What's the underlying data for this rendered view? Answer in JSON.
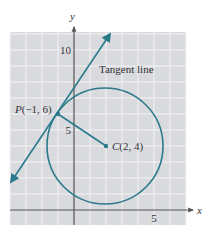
{
  "diagram": {
    "axes": {
      "x_label": "x",
      "y_label": "y",
      "x_ticks": [
        {
          "value": 5,
          "label": "5"
        }
      ],
      "y_ticks": [
        {
          "value": 5,
          "label": "5"
        },
        {
          "value": 10,
          "label": "10"
        }
      ],
      "x_range": [
        -4,
        7
      ],
      "y_range": [
        -1,
        11.5
      ],
      "grid": true,
      "grid_step": 1
    },
    "circle": {
      "center": {
        "x": 2,
        "y": 4
      },
      "radius": 3.606
    },
    "points": {
      "P": {
        "x": -1,
        "y": 6,
        "label": "P(−1, 6)",
        "name_letter": "P",
        "coords": "(−1, 6)"
      },
      "C": {
        "x": 2,
        "y": 4,
        "label": "C(2, 4)",
        "name_letter": "C",
        "coords": "(2, 4)"
      }
    },
    "tangent_line": {
      "label": "Tangent line",
      "slope": 1.5,
      "passes_through": {
        "x": -1,
        "y": 6
      }
    },
    "radius_segment": {
      "from": "P",
      "to": "C"
    },
    "colors": {
      "curve": "#2b7a8c",
      "grid_bg": "#d9dadd",
      "grid_line": "#f4f4f6",
      "axis": "#555559",
      "text": "#333338"
    }
  }
}
